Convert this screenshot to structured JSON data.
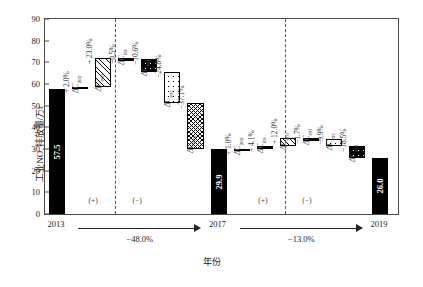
{
  "axes": {
    "y_label_main": "工业NO",
    "y_label_sub": "x",
    "y_label_tail": "排放量/万t",
    "x_label": "年份",
    "yticks": [
      "0",
      "10",
      "20",
      "30",
      "40",
      "50",
      "60",
      "70",
      "80",
      "90"
    ]
  },
  "periods": [
    {
      "name": "period-2013-2017",
      "total_label": "−48.0%",
      "plus_sign": "(+)",
      "minus_sign": "(−)"
    },
    {
      "name": "period-2017-2019",
      "total_label": "−13.0%",
      "plus_sign": "(+)",
      "minus_sign": "(−)"
    }
  ],
  "chart_data": {
    "type": "bar",
    "subtype": "waterfall-lmdi-decomposition",
    "title": "",
    "xlabel": "年份",
    "ylabel": "工业NOx排放量/万t",
    "ylim": [
      0,
      90
    ],
    "ytick_step": 10,
    "grid": false,
    "legend": "none",
    "anchors": [
      {
        "label": "2013",
        "value": 57.5,
        "value_text": "57.5",
        "fill": "solid"
      },
      {
        "label": "2017",
        "value": 29.9,
        "value_text": "29.9",
        "fill": "solid"
      },
      {
        "label": "2019",
        "value": 26.0,
        "value_text": "26.0",
        "fill": "solid"
      }
    ],
    "period_totals": [
      {
        "from": "2013",
        "to": "2017",
        "change_pct": -48.0,
        "text": "−48.0%"
      },
      {
        "from": "2017",
        "to": "2019",
        "change_pct": -13.0,
        "text": "−13.0%"
      }
    ],
    "series": [
      {
        "name": "2013-2017 decomposition",
        "bars": [
          {
            "effect": "ΔC",
            "sub": "pop",
            "pct": 2.0,
            "pct_text": "+ 2.0%",
            "sign": "+",
            "start": 57.5,
            "end": 58.7,
            "fill": "brick"
          },
          {
            "effect": "ΔC",
            "sub": "eco",
            "pct": 23.0,
            "pct_text": "+ 23.0%",
            "sign": "+",
            "start": 58.7,
            "end": 71.9,
            "fill": "hatch45"
          },
          {
            "effect": "ΔC",
            "sub": "ins",
            "pct": -0.5,
            "pct_text": "−0.5%",
            "sign": "−",
            "start": 71.9,
            "end": 71.6,
            "fill": "plain"
          },
          {
            "effect": "ΔC",
            "sub": "enl",
            "pct": -10.6,
            "pct_text": "−10.6%",
            "sign": "−",
            "start": 71.6,
            "end": 65.5,
            "fill": "dotw"
          },
          {
            "effect": "ΔC",
            "sub": "enc",
            "pct": -24.8,
            "pct_text": "−24.8%",
            "sign": "−",
            "start": 65.5,
            "end": 51.2,
            "fill": "dotb"
          },
          {
            "effect": "ΔC",
            "sub": "emi",
            "pct": -37.1,
            "pct_text": "−37.1%",
            "sign": "−",
            "start": 51.2,
            "end": 29.9,
            "fill": "hatchx"
          }
        ]
      },
      {
        "name": "2017-2019 decomposition",
        "bars": [
          {
            "effect": "ΔC",
            "sub": "pop",
            "pct": 1.0,
            "pct_text": "+ 1.0%",
            "sign": "+",
            "start": 29.9,
            "end": 30.2,
            "fill": "plain"
          },
          {
            "effect": "ΔC",
            "sub": "ins",
            "pct": 4.1,
            "pct_text": "+ 4.1%",
            "sign": "+",
            "start": 30.2,
            "end": 31.4,
            "fill": "thinline"
          },
          {
            "effect": "ΔC",
            "sub": "eco",
            "pct": 12.0,
            "pct_text": "+ 12.0%",
            "sign": "+",
            "start": 31.4,
            "end": 35.0,
            "fill": "hatch45"
          },
          {
            "effect": "ΔC",
            "sub": "enl",
            "pct": -1.7,
            "pct_text": "−1.7%",
            "sign": "−",
            "start": 35.0,
            "end": 34.5,
            "fill": "brick"
          },
          {
            "effect": "ΔC",
            "sub": "enc",
            "pct": -9.9,
            "pct_text": "−9.9%",
            "sign": "−",
            "start": 34.5,
            "end": 31.5,
            "fill": "dotb"
          },
          {
            "effect": "ΔC",
            "sub": "emi",
            "pct": -18.5,
            "pct_text": "−18.5%",
            "sign": "−",
            "start": 31.5,
            "end": 26.0,
            "fill": "dotw"
          }
        ]
      }
    ]
  }
}
